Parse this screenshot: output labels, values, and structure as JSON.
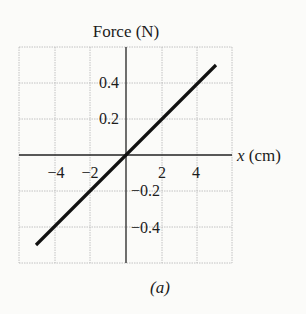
{
  "chart_data": {
    "type": "line",
    "title": "Force (N)",
    "ylabel": "Force (N)",
    "xlabel": "x (cm)",
    "caption": "(a)",
    "xlim": [
      -6,
      6
    ],
    "ylim": [
      -0.6,
      0.6
    ],
    "grid": true,
    "x_ticks": [
      -4,
      -2,
      2,
      4
    ],
    "x_tick_labels": [
      "−4",
      "−2",
      "2",
      "4"
    ],
    "y_ticks": [
      0.4,
      0.2,
      -0.2,
      -0.4
    ],
    "y_tick_labels": [
      "0.4",
      "0.2",
      "−0.2",
      "−0.4"
    ],
    "series": [
      {
        "name": "Force vs displacement",
        "x": [
          -5,
          5
        ],
        "y": [
          -0.5,
          0.5
        ],
        "color": "#111111"
      }
    ],
    "legend": null
  },
  "colors": {
    "background": "#fbfbf9",
    "grid": "#b8b8b8",
    "axis": "#222222",
    "line": "#111111"
  }
}
